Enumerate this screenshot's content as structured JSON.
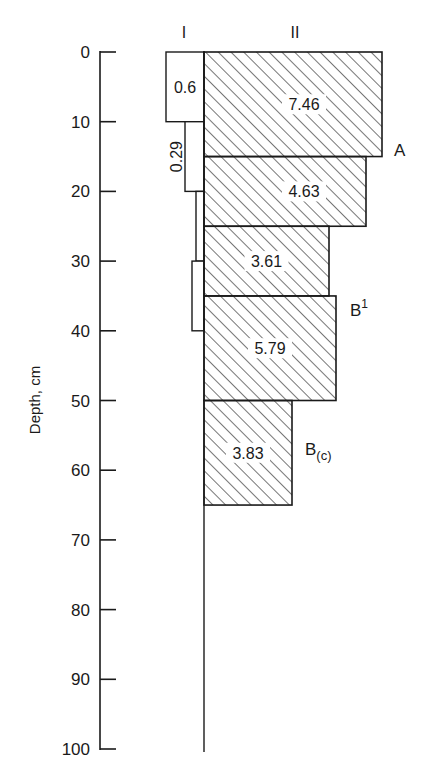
{
  "chart_data": {
    "type": "bar",
    "orientation": "horizontal-depth-profile",
    "title": "",
    "ylabel": "Depth, cm",
    "xlabel": "",
    "ylim": [
      0,
      100
    ],
    "yticks": [
      0,
      10,
      20,
      30,
      40,
      50,
      60,
      70,
      80,
      90,
      100
    ],
    "grid": false,
    "legend": null,
    "columns": [
      {
        "name": "I",
        "direction": "left"
      },
      {
        "name": "II",
        "direction": "right",
        "pattern": "diagonal-hatch"
      }
    ],
    "series": [
      {
        "name": "I",
        "bars": [
          {
            "depth_top": 0,
            "depth_bottom": 10,
            "value": 0.6,
            "label": "0.6",
            "label_rotated": false,
            "px_width": 38
          },
          {
            "depth_top": 10,
            "depth_bottom": 20,
            "value": 0.29,
            "label": "0.29",
            "label_rotated": true,
            "px_width": 19
          },
          {
            "depth_top": 20,
            "depth_bottom": 30,
            "value": null,
            "label": "",
            "label_rotated": false,
            "px_width": 8
          },
          {
            "depth_top": 30,
            "depth_bottom": 40,
            "value": null,
            "label": "",
            "label_rotated": false,
            "px_width": 12
          }
        ]
      },
      {
        "name": "II",
        "bars": [
          {
            "depth_top": 0,
            "depth_bottom": 15,
            "value": 7.46,
            "label": "7.46",
            "px_width": 178
          },
          {
            "depth_top": 15,
            "depth_bottom": 25,
            "value": 4.63,
            "label": "4.63",
            "px_width": 162
          },
          {
            "depth_top": 25,
            "depth_bottom": 35,
            "value": 3.61,
            "label": "3.61",
            "px_width": 125
          },
          {
            "depth_top": 35,
            "depth_bottom": 50,
            "value": 5.79,
            "label": "5.79",
            "px_width": 132
          },
          {
            "depth_top": 50,
            "depth_bottom": 65,
            "value": 3.83,
            "label": "3.83",
            "px_width": 88
          }
        ]
      }
    ],
    "annotations": [
      {
        "text": "A",
        "sub": "",
        "sup": "",
        "depth": 14
      },
      {
        "text": "B",
        "sub": "",
        "sup": "1",
        "depth": 37
      },
      {
        "text": "B",
        "sub": "(c)",
        "sup": "",
        "depth": 57
      }
    ]
  },
  "colors": {
    "ink": "#1a1a1a",
    "background": "#ffffff"
  }
}
